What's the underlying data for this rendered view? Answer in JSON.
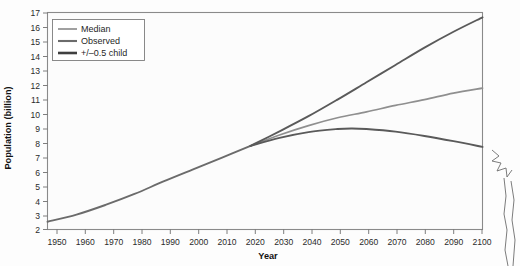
{
  "chart_data": {
    "type": "line",
    "title": "",
    "xlabel": "Year",
    "ylabel": "Population (billion)",
    "xlim": [
      1950,
      2100
    ],
    "ylim": [
      2,
      17
    ],
    "grid": false,
    "legend_position": "top-left",
    "xticks": [
      1950,
      1960,
      1970,
      1980,
      1990,
      2000,
      2010,
      2020,
      2030,
      2040,
      2050,
      2060,
      2070,
      2080,
      2090,
      2100
    ],
    "yticks": [
      2,
      3,
      4,
      5,
      6,
      7,
      8,
      9,
      10,
      11,
      12,
      13,
      14,
      15,
      16,
      17
    ],
    "series": [
      {
        "name": "Observed",
        "color": "#6b6b6b",
        "width": 1.9,
        "x": [
          1950,
          1960,
          1970,
          1980,
          1990,
          2000,
          2010,
          2020
        ],
        "values": [
          2.54,
          3.03,
          3.7,
          4.46,
          5.33,
          6.15,
          6.96,
          7.79
        ]
      },
      {
        "name": "Median",
        "color": "#8f8f8f",
        "width": 1.7,
        "x": [
          2020,
          2030,
          2040,
          2050,
          2060,
          2070,
          2080,
          2090,
          2100
        ],
        "values": [
          7.79,
          8.55,
          9.2,
          9.74,
          10.15,
          10.6,
          11.0,
          11.45,
          11.8
        ]
      },
      {
        "name": "+/-0.5 child high",
        "color": "#5a5a5a",
        "width": 1.9,
        "x": [
          2020,
          2030,
          2040,
          2050,
          2060,
          2070,
          2080,
          2090,
          2100
        ],
        "values": [
          7.79,
          8.8,
          9.85,
          11.0,
          12.2,
          13.4,
          14.6,
          15.7,
          16.7
        ]
      },
      {
        "name": "+/-0.5 child low",
        "color": "#5a5a5a",
        "width": 1.9,
        "x": [
          2020,
          2030,
          2040,
          2050,
          2055,
          2060,
          2070,
          2080,
          2090,
          2100
        ],
        "values": [
          7.79,
          8.35,
          8.75,
          8.96,
          9.0,
          8.96,
          8.78,
          8.48,
          8.12,
          7.72
        ]
      }
    ],
    "legend": [
      {
        "label": "Median",
        "color": "#8f8f8f",
        "width": 1.7
      },
      {
        "label": "Observed",
        "color": "#6b6b6b",
        "width": 2.1
      },
      {
        "label": "+/–0.5 child",
        "color": "#3f3f3f",
        "width": 2.6
      }
    ]
  },
  "axes": {
    "ylabel": "Population (billion)",
    "xlabel": "Year"
  }
}
